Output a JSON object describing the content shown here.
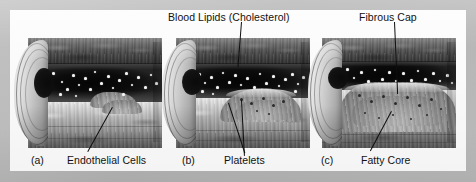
{
  "figure": {
    "background_color": "#b9b9b9",
    "page_color": "#fbfbfb",
    "label_color": "#121212",
    "leader_color": "#0e0e0e"
  },
  "labels": {
    "blood_lipids": "Blood Lipids (Cholesterol)",
    "fibrous_cap": "Fibrous Cap",
    "endothelial_cells": "Endothelial Cells",
    "platelets": "Platelets",
    "fatty_core": "Fatty Core"
  },
  "panels": [
    {
      "letter": "(a)",
      "stage_labels": [
        "Endothelial Cells"
      ],
      "description": "Normal artery with intact endothelium and early fatty streak"
    },
    {
      "letter": "(b)",
      "stage_labels": [
        "Blood Lipids (Cholesterol)",
        "Platelets"
      ],
      "description": "Developing plaque with platelet accumulation narrowing the lumen"
    },
    {
      "letter": "(c)",
      "stage_labels": [
        "Fibrous Cap",
        "Fatty Core"
      ],
      "description": "Advanced plaque with fibrous cap over a fatty core"
    }
  ],
  "icons": {
    "lipid_speckle": "lipid-droplet-icon",
    "leader_line": "pointer-line-icon"
  }
}
